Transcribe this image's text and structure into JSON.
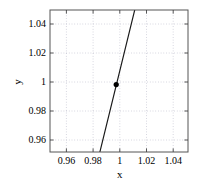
{
  "chart_data": {
    "type": "line",
    "title": "",
    "xlabel": "x",
    "ylabel": "y",
    "xlim": [
      0.9513,
      1.0528
    ],
    "ylim": [
      0.9552,
      1.0495
    ],
    "xticks": [
      0.96,
      0.98,
      1,
      1.02,
      1.04
    ],
    "xticklabels": [
      "0.96",
      "0.98",
      "1",
      "1.02",
      "1.04"
    ],
    "yticks": [
      0.96,
      0.98,
      1,
      1.02,
      1.04
    ],
    "yticklabels": [
      "0.96",
      "0.98",
      "1",
      "1.02",
      "1.04"
    ],
    "grid": true,
    "grid_style": "dotted",
    "grid_color": "#b8b8c8",
    "frame_color": "#555555",
    "legend": null,
    "series": [
      {
        "name": "line",
        "type": "line",
        "color": "#1a1a1a",
        "linewidth": 1.1,
        "x": [
          0.988,
          1.0136
        ],
        "y": [
          0.9552,
          1.0495
        ]
      },
      {
        "name": "marker",
        "type": "scatter",
        "color": "#000000",
        "marker": "circle",
        "markersize": 4.2,
        "x": [
          1.0
        ],
        "y": [
          1.0
        ]
      }
    ],
    "annotations": []
  },
  "axes": {
    "x_title": "x",
    "y_title": "y"
  }
}
